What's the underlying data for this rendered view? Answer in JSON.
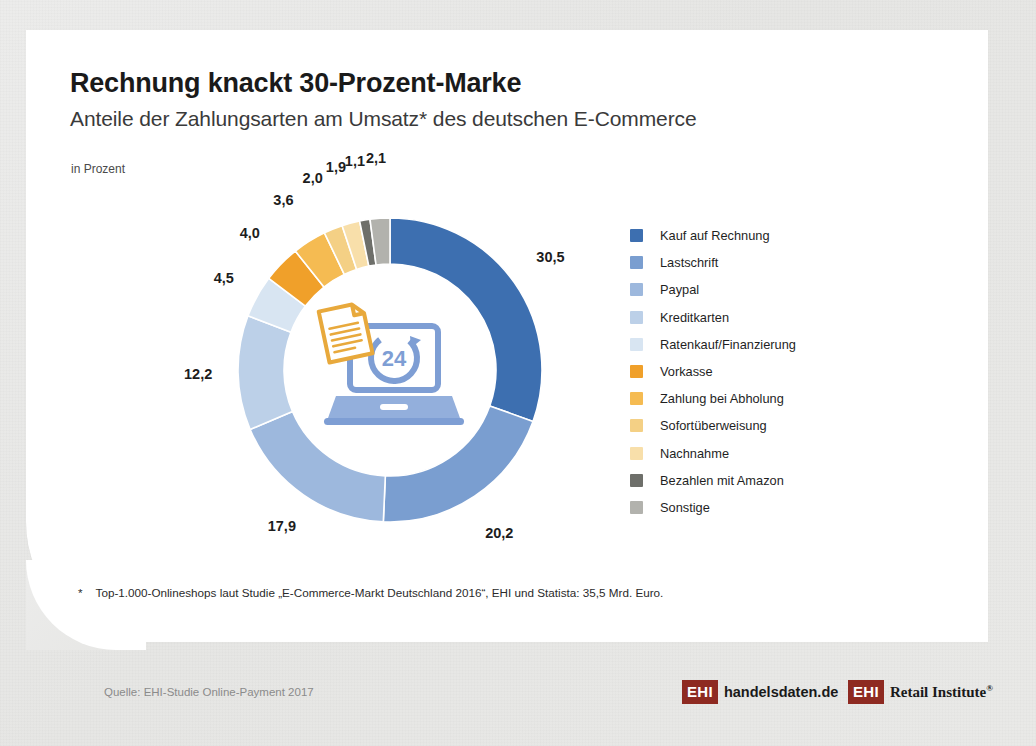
{
  "header": {
    "headline": "Rechnung knackt 30-Prozent-Marke",
    "subhead": "Anteile der Zahlungsarten am Umsatz* des deutschen E-Commerce",
    "unit_label": "in Prozent"
  },
  "footnote": {
    "star": "*",
    "text": "Top-1.000-Onlineshops laut Studie „E-Commerce-Markt Deutschland 2016“, EHI und Statista: 35,5 Mrd. Euro."
  },
  "footer": {
    "source": "Quelle: EHI-Studie Online-Payment 2017",
    "logos": [
      {
        "badge": "EHI",
        "name": "handelsdaten.de",
        "registered": ""
      },
      {
        "badge": "EHI",
        "name": "Retail Institute",
        "registered": "®"
      }
    ],
    "badge_color": "#8e2a21"
  },
  "chart_data": {
    "type": "pie",
    "title": "Rechnung knackt 30-Prozent-Marke",
    "subtitle": "Anteile der Zahlungsarten am Umsatz* des deutschen E-Commerce",
    "ylabel": "in Prozent",
    "unit": "Prozent",
    "donut": true,
    "start_angle_deg": 0,
    "direction": "clockwise",
    "legend_position": "right",
    "total": 100.0,
    "categories": [
      "Kauf auf Rechnung",
      "Lastschrift",
      "Paypal",
      "Kreditkarten",
      "Ratenkauf/Finanzierung",
      "Vorkasse",
      "Zahlung bei Abholung",
      "Sofortüberweisung",
      "Nachnahme",
      "Bezahlen mit Amazon",
      "Sonstige"
    ],
    "values": [
      30.5,
      20.2,
      17.9,
      12.2,
      4.5,
      4.0,
      3.6,
      2.0,
      1.9,
      1.1,
      2.1
    ],
    "value_labels": [
      "30,5",
      "20,2",
      "17,9",
      "12,2",
      "4,5",
      "4,0",
      "3,6",
      "2,0",
      "1,9",
      "1,1",
      "2,1"
    ],
    "colors": [
      "#3d6fb0",
      "#7a9ed0",
      "#9db8dd",
      "#bcd0e8",
      "#d8e5f2",
      "#f0a02a",
      "#f5bb52",
      "#f4d085",
      "#f8dfaa",
      "#6e6f6a",
      "#b2b2ad"
    ]
  },
  "center_icon": {
    "name": "laptop-invoice-24h-icon",
    "laptop_color": "#7e9ed4",
    "document_color": "#e8a93c",
    "badge_text": "24"
  }
}
